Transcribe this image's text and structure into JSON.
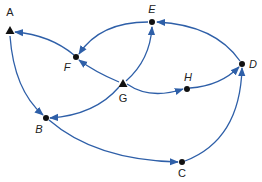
{
  "diagram": {
    "type": "directed-graph",
    "edge_color": "#2e5fa8",
    "node_color": "#111111",
    "nodes": [
      {
        "id": "A",
        "label": "A",
        "shape": "triangle",
        "x": 10,
        "y": 31,
        "lx": 10,
        "ly": 16,
        "italic": false
      },
      {
        "id": "E",
        "label": "E",
        "shape": "dot",
        "x": 152,
        "y": 22,
        "lx": 152,
        "ly": 13,
        "italic": true
      },
      {
        "id": "F",
        "label": "F",
        "shape": "dot",
        "x": 76,
        "y": 57,
        "lx": 67,
        "ly": 71,
        "italic": true
      },
      {
        "id": "G",
        "label": "G",
        "shape": "triangle",
        "x": 123,
        "y": 84,
        "lx": 123,
        "ly": 102,
        "italic": false
      },
      {
        "id": "H",
        "label": "H",
        "shape": "dot",
        "x": 187,
        "y": 89,
        "lx": 188,
        "ly": 81,
        "italic": true
      },
      {
        "id": "D",
        "label": "D",
        "shape": "dot",
        "x": 242,
        "y": 64,
        "lx": 253,
        "ly": 68,
        "italic": true
      },
      {
        "id": "B",
        "label": "B",
        "shape": "dot",
        "x": 46,
        "y": 118,
        "lx": 39,
        "ly": 133,
        "italic": true
      },
      {
        "id": "C",
        "label": "C",
        "shape": "dot",
        "x": 182,
        "y": 162,
        "lx": 182,
        "ly": 177,
        "italic": false
      }
    ],
    "edges": [
      {
        "from": "A",
        "to": "B",
        "path": "M 10 36 Q 14 90 43 115"
      },
      {
        "from": "F",
        "to": "A",
        "path": "M 74 55 Q 50 35 15 32"
      },
      {
        "from": "E",
        "to": "F",
        "path": "M 148 22 Q 100 22 79 54"
      },
      {
        "from": "G",
        "to": "F",
        "path": "M 119 82 Q 95 72 79 60"
      },
      {
        "from": "G",
        "to": "E",
        "path": "M 126 81 Q 150 60 152 27"
      },
      {
        "from": "D",
        "to": "E",
        "path": "M 240 61 Q 215 25 157 22"
      },
      {
        "from": "G",
        "to": "B",
        "path": "M 119 87 Q 95 115 50 118"
      },
      {
        "from": "G",
        "to": "H",
        "path": "M 127 84 Q 150 100 183 89"
      },
      {
        "from": "H",
        "to": "D",
        "path": "M 190 88 Q 220 86 239 67"
      },
      {
        "from": "B",
        "to": "C",
        "path": "M 49 120 Q 95 160 178 162"
      },
      {
        "from": "C",
        "to": "D",
        "path": "M 185 161 Q 240 140 242 68"
      }
    ]
  }
}
